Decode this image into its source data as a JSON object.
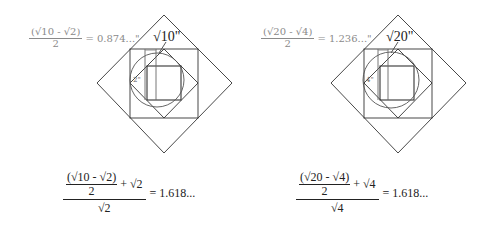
{
  "left_figure": {
    "top_label": {
      "numerator": "(√10 - √2)",
      "denominator": "2",
      "result": "= 0.874...\""
    },
    "side_label": "√10\"",
    "angle_label": "2\"",
    "formula": {
      "inner_numerator": "(√10 - √2)",
      "inner_denominator": "2",
      "plus_term": "+ √2",
      "denominator": "√2",
      "result": "= 1.618..."
    },
    "geometry": {
      "outer_diamond": [
        [
          164,
          15
        ],
        [
          232,
          83
        ],
        [
          164,
          153
        ],
        [
          97,
          83
        ]
      ],
      "outer_square": {
        "x": 130,
        "y": 49,
        "w": 68,
        "h": 69
      },
      "inner_diamond": [
        [
          164,
          49
        ],
        [
          198,
          83
        ],
        [
          164,
          118
        ],
        [
          130,
          83
        ]
      ],
      "inner_square": {
        "x": 147,
        "y": 66,
        "w": 34,
        "h": 34
      },
      "circle": {
        "cx": 157,
        "cy": 80,
        "r": 27
      },
      "vlines": [
        145,
        156
      ]
    }
  },
  "right_figure": {
    "top_label": {
      "numerator": "(√20 - √4)",
      "denominator": "2",
      "result": "= 1.236...\""
    },
    "side_label": "√20\"",
    "angle_label": "4\"",
    "formula": {
      "inner_numerator": "(√20 - √4)",
      "inner_denominator": "2",
      "plus_term": "+ √4",
      "denominator": "√4",
      "result": "= 1.618..."
    },
    "geometry": {
      "outer_diamond": [
        [
          398,
          15
        ],
        [
          466,
          83
        ],
        [
          398,
          153
        ],
        [
          331,
          83
        ]
      ],
      "outer_square": {
        "x": 364,
        "y": 49,
        "w": 68,
        "h": 69
      },
      "inner_diamond": [
        [
          398,
          49
        ],
        [
          432,
          83
        ],
        [
          398,
          118
        ],
        [
          364,
          83
        ]
      ],
      "inner_square": {
        "x": 380,
        "y": 66,
        "w": 34,
        "h": 34
      },
      "circle": {
        "cx": 391,
        "cy": 80,
        "r": 28
      },
      "vlines": [
        378,
        388
      ]
    }
  },
  "colors": {
    "line": "#333333",
    "label_gray": "#8a8a8a",
    "circle": "#555555"
  }
}
